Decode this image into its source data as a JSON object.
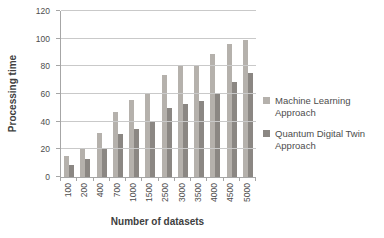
{
  "chart_data": {
    "type": "bar",
    "title": "",
    "xlabel": "Number of datasets",
    "ylabel": "Processing time",
    "categories": [
      "100",
      "200",
      "400",
      "700",
      "1000",
      "1500",
      "2500",
      "3000",
      "3500",
      "4000",
      "4500",
      "5000"
    ],
    "series": [
      {
        "name": "Machine Learning Approach",
        "color": "#b5b1ac",
        "values": [
          15,
          21,
          32,
          47,
          56,
          61,
          74,
          80,
          81,
          89,
          96,
          99
        ]
      },
      {
        "name": "Quantum Digital Twin Approach",
        "color": "#8b8783",
        "values": [
          9,
          13,
          21,
          31,
          35,
          40,
          50,
          53,
          55,
          60,
          69,
          75
        ]
      }
    ],
    "ylim": [
      0,
      120
    ],
    "yticks": [
      0,
      20,
      40,
      60,
      80,
      100,
      120
    ],
    "grid": true,
    "legend_position": "right"
  },
  "colors": {
    "background": "#ffffff",
    "gridline": "#c9c9c9",
    "axis": "#a6a6a6",
    "tick_text": "#4d4d4d",
    "axis_title_text": "#404040"
  }
}
